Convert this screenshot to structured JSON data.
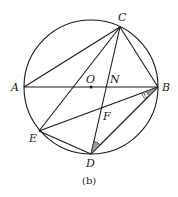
{
  "figure": {
    "caption": "(b)",
    "colors": {
      "stroke": "#1a1a1a",
      "shade": "#9a9a9a",
      "background": "#ffffff"
    },
    "circle": {
      "center": "O",
      "cx": 91,
      "cy": 87,
      "r": 68
    },
    "points": {
      "A": {
        "label": "A",
        "x": 24,
        "y": 87
      },
      "B": {
        "label": "B",
        "x": 158,
        "y": 87
      },
      "C": {
        "label": "C",
        "x": 120,
        "y": 27
      },
      "D": {
        "label": "D",
        "x": 91,
        "y": 154
      },
      "E": {
        "label": "E",
        "x": 39,
        "y": 131
      },
      "O": {
        "label": "O",
        "x": 91,
        "y": 87
      },
      "N": {
        "label": "N",
        "x": 108,
        "y": 87
      },
      "F": {
        "label": "F",
        "x": 101,
        "y": 110
      }
    },
    "segments": [
      "AB",
      "AC",
      "CB",
      "CE",
      "CD",
      "EB",
      "ED",
      "DB"
    ],
    "marked_angles": [
      "angle EBD (shaded, double arc)",
      "angle CDB (shaded)"
    ]
  }
}
